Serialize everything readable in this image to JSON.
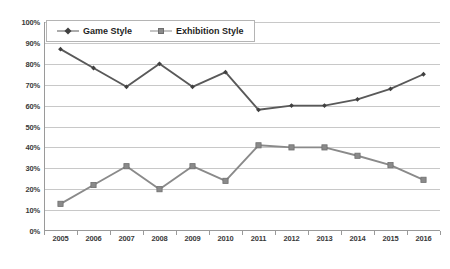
{
  "chart_data": {
    "type": "line",
    "title": "",
    "xlabel": "",
    "ylabel": "",
    "categories": [
      "2005",
      "2006",
      "2007",
      "2008",
      "2009",
      "2010",
      "2011",
      "2012",
      "2013",
      "2014",
      "2015",
      "2016"
    ],
    "series": [
      {
        "name": "Game Style",
        "marker": "diamond",
        "color": "#595959",
        "values": [
          87,
          78,
          69,
          80,
          69,
          76,
          58,
          60,
          60,
          63,
          68,
          75
        ]
      },
      {
        "name": "Exhibition Style",
        "marker": "square",
        "color": "#8a8a8a",
        "values": [
          13,
          22,
          31,
          20,
          31,
          24,
          41,
          40,
          40,
          36,
          31.5,
          24.5
        ]
      }
    ],
    "ylim": [
      0,
      100
    ],
    "ytick_labels": [
      "0%",
      "10%",
      "20%",
      "30%",
      "40%",
      "50%",
      "60%",
      "70%",
      "80%",
      "90%",
      "100%"
    ],
    "ytick_values": [
      0,
      10,
      20,
      30,
      40,
      50,
      60,
      70,
      80,
      90,
      100
    ],
    "grid": true,
    "grid_axis": "y",
    "legend_position": "top-left",
    "legend_entries": [
      "Game Style",
      "Exhibition Style"
    ],
    "background_color": "#ffffff",
    "gridline_color": "#c8c8c8",
    "axis_color": "#9a9a9a"
  }
}
